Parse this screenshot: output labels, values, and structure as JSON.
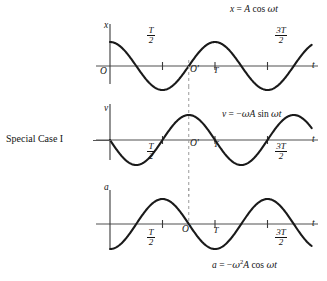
{
  "figure": {
    "case_label": "Special Case I",
    "background": "#ffffff",
    "curve_color": "#1a1a1a",
    "axis_color": "#8a8a8a",
    "dashed_color": "#9a9a9a"
  },
  "graphs": [
    {
      "id": "displacement",
      "equation_plain": "x = A cos ωt",
      "vertical_axis_label": "x",
      "horizontal_axis_label": "t",
      "origin_label": "O",
      "second_origin_label": "O′",
      "tick_labels": [
        "T/2",
        "T",
        "3T/2"
      ]
    },
    {
      "id": "velocity",
      "equation_plain": "v = −ωA sin ωt",
      "vertical_axis_label": "v",
      "horizontal_axis_label": "t",
      "origin_label": "",
      "second_origin_label": "O′",
      "tick_labels": [
        "T/2",
        "T",
        "3T/2"
      ]
    },
    {
      "id": "acceleration",
      "equation_plain": "a = −ω²A cos ωt",
      "vertical_axis_label": "a",
      "horizontal_axis_label": "t",
      "origin_label": "",
      "second_origin_label": "O′",
      "tick_labels": [
        "T/2",
        "T",
        "3T/2"
      ]
    }
  ],
  "labels": {
    "x": "x",
    "v": "v",
    "a": "a",
    "t": "t",
    "O": "O",
    "Oprime": "O′",
    "T": "T",
    "num_T": "T",
    "den_2": "2",
    "num_3T": "3T",
    "den2_2": "2"
  },
  "chart_data": {
    "type": "line",
    "xlabel": "t",
    "ylabel": "x, v, a",
    "grid": false,
    "legend": "none",
    "xlim": [
      -0.12,
      1.85
    ],
    "x_tick_values": [
      0,
      0.5,
      1.0,
      1.5
    ],
    "x_tick_labels": [
      "O",
      "T/2",
      "T",
      "3T/2"
    ],
    "annotations": [
      {
        "text": "O′",
        "x": 0.75,
        "note": "shifted origin at t = 3T/4 on every graph"
      },
      {
        "text": "dashed vertical line",
        "x": 0.75
      }
    ],
    "series": [
      {
        "name": "x = A cos ωt",
        "ylabel": "x",
        "amplitude": 1.0,
        "amplitude_symbol": "A",
        "phase": "cos",
        "formula": "x = A cos(2π t / T)",
        "ylim": [
          -1.25,
          1.25
        ],
        "x": [
          0,
          0.125,
          0.25,
          0.375,
          0.5,
          0.625,
          0.75,
          0.875,
          1.0,
          1.125,
          1.25,
          1.375,
          1.5,
          1.625,
          1.75
        ],
        "values": [
          1.0,
          0.707,
          0.0,
          -0.707,
          -1.0,
          -0.707,
          0.0,
          0.707,
          1.0,
          0.707,
          0.0,
          -0.707,
          -1.0,
          -0.707,
          0.0
        ]
      },
      {
        "name": "v = −ωA sin ωt",
        "ylabel": "v",
        "amplitude": 1.0,
        "amplitude_symbol": "ωA",
        "phase": "-sin",
        "formula": "v = −ωA sin(2π t / T)",
        "ylim": [
          -1.25,
          1.25
        ],
        "x": [
          0,
          0.125,
          0.25,
          0.375,
          0.5,
          0.625,
          0.75,
          0.875,
          1.0,
          1.125,
          1.25,
          1.375,
          1.5,
          1.625,
          1.75
        ],
        "values": [
          0.0,
          -0.707,
          -1.0,
          -0.707,
          0.0,
          0.707,
          1.0,
          0.707,
          0.0,
          -0.707,
          -1.0,
          -0.707,
          0.0,
          0.707,
          1.0
        ]
      },
      {
        "name": "a = −ω²A cos ωt",
        "ylabel": "a",
        "amplitude": 1.0,
        "amplitude_symbol": "ω²A",
        "phase": "-cos",
        "formula": "a = −ω²A cos(2π t / T)",
        "ylim": [
          -1.25,
          1.25
        ],
        "x": [
          0,
          0.125,
          0.25,
          0.375,
          0.5,
          0.625,
          0.75,
          0.875,
          1.0,
          1.125,
          1.25,
          1.375,
          1.5,
          1.625,
          1.75
        ],
        "values": [
          -1.0,
          -0.707,
          0.0,
          0.707,
          1.0,
          0.707,
          0.0,
          -0.707,
          -1.0,
          -0.707,
          0.0,
          0.707,
          1.0,
          0.707,
          0.0
        ]
      }
    ]
  }
}
